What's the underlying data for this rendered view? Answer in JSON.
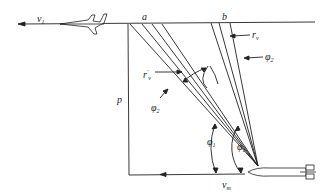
{
  "diagram": {
    "title": "",
    "colors": {
      "line": "#222222",
      "background": "#ffffff"
    },
    "labels": {
      "v1": {
        "base": "v",
        "sub": "1"
      },
      "a": {
        "base": "a"
      },
      "b": {
        "base": "b"
      },
      "rv": {
        "base": "r",
        "sub": "v"
      },
      "rv_prime": {
        "base": "r",
        "sup": "′",
        "sub": "v"
      },
      "phi2_right": {
        "base": "φ",
        "sub": "2"
      },
      "phi2_left": {
        "base": "φ",
        "sub": "2"
      },
      "phi1": {
        "base": "φ",
        "sub": "1"
      },
      "phi": {
        "base": "φ",
        "sub": "1"
      },
      "p": {
        "base": "p"
      },
      "vm": {
        "base": "v",
        "sub": "m"
      }
    },
    "objects": {
      "aircraft": "aircraft-icon",
      "missile": "missile-icon"
    }
  }
}
